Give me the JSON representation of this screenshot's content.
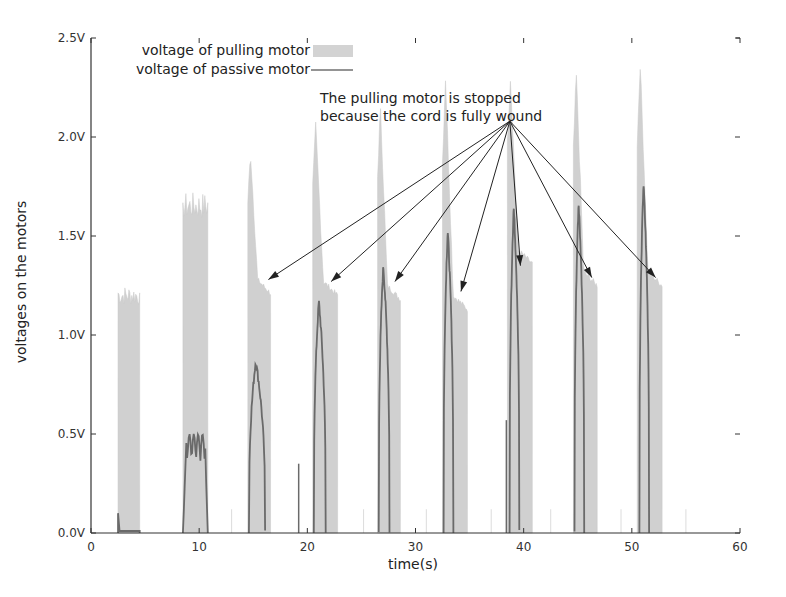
{
  "chart_data": {
    "type": "area",
    "title": "",
    "xlabel": "time(s)",
    "ylabel": "voltages on the motors",
    "xlim": [
      0,
      60
    ],
    "ylim": [
      0,
      2.5
    ],
    "x_ticks": [
      "0",
      "10",
      "20",
      "30",
      "40",
      "50",
      "60"
    ],
    "y_ticks": [
      "0.0V",
      "0.5V",
      "1.0V",
      "1.5V",
      "2.0V",
      "2.5V"
    ],
    "grid": false,
    "legend_position": "top-left",
    "legend": [
      {
        "label": "voltage of pulling motor",
        "style": "filled-gray",
        "color": "#cfcfcf"
      },
      {
        "label": "voltage of passive motor",
        "style": "line",
        "color": "#6e6e6e"
      }
    ],
    "annotation": {
      "text_line1": "The pulling motor is stopped",
      "text_line2": "because the cord is fully wound",
      "arrow_origin": [
        39.0,
        2.08
      ],
      "arrow_targets": [
        [
          16.4,
          1.28
        ],
        [
          22.2,
          1.27
        ],
        [
          28.1,
          1.27
        ],
        [
          34.2,
          1.22
        ],
        [
          39.7,
          1.35
        ],
        [
          46.3,
          1.29
        ],
        [
          52.2,
          1.29
        ]
      ]
    },
    "series": [
      {
        "name": "voltage of pulling motor",
        "bursts": [
          {
            "start": 2.5,
            "end": 4.5,
            "peak": 1.25,
            "plateau": 1.25
          },
          {
            "start": 8.5,
            "end": 10.8,
            "peak": 1.72,
            "plateau": 1.5
          },
          {
            "start": 14.5,
            "end": 16.6,
            "peak": 1.92,
            "plateau": 1.28
          },
          {
            "start": 20.5,
            "end": 22.8,
            "peak": 2.05,
            "plateau": 1.27
          },
          {
            "start": 26.5,
            "end": 28.6,
            "peak": 2.15,
            "plateau": 1.25
          },
          {
            "start": 32.5,
            "end": 34.8,
            "peak": 2.3,
            "plateau": 1.2
          },
          {
            "start": 38.5,
            "end": 40.8,
            "peak": 2.3,
            "plateau": 1.43
          },
          {
            "start": 44.6,
            "end": 46.8,
            "peak": 2.32,
            "plateau": 1.32
          },
          {
            "start": 50.5,
            "end": 52.8,
            "peak": 2.37,
            "plateau": 1.32
          }
        ]
      },
      {
        "name": "voltage of passive motor",
        "peaks": [
          {
            "start": 2.5,
            "end": 4.5,
            "peak": 0.1
          },
          {
            "start": 8.5,
            "end": 10.8,
            "peak": 0.5
          },
          {
            "start": 14.6,
            "end": 16.1,
            "peak": 0.87
          },
          {
            "start": 20.6,
            "end": 21.7,
            "peak": 1.17
          },
          {
            "start": 26.6,
            "end": 27.6,
            "peak": 1.35
          },
          {
            "start": 32.6,
            "end": 33.5,
            "peak": 1.53
          },
          {
            "start": 38.7,
            "end": 39.6,
            "peak": 1.65
          },
          {
            "start": 44.7,
            "end": 45.6,
            "peak": 1.67
          },
          {
            "start": 50.7,
            "end": 51.6,
            "peak": 1.77
          }
        ],
        "spikes": [
          {
            "x": 19.2,
            "y": 0.35
          },
          {
            "x": 38.4,
            "y": 0.57
          }
        ]
      }
    ]
  }
}
